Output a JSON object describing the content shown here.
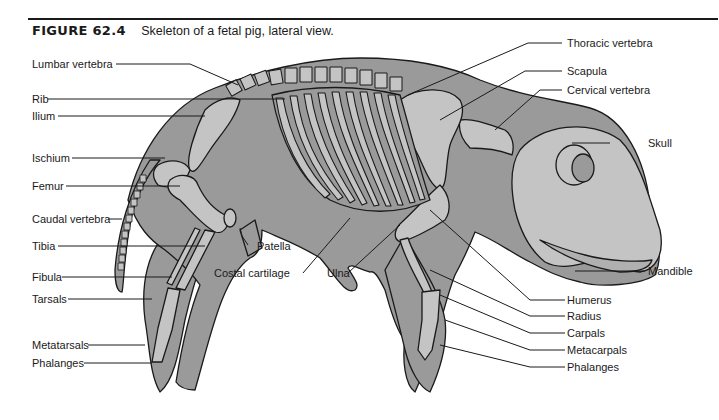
{
  "figure": {
    "number": "FIGURE 62.4",
    "caption": "Skeleton of a fetal pig, lateral view."
  },
  "colors": {
    "body": "#9a9a9a",
    "bone": "#c4c4c4",
    "outline": "#1a1a1a",
    "text": "#1a1a1a",
    "rule": "#1a1a1a"
  },
  "labels": {
    "left": [
      {
        "id": "lumbar-vertebra",
        "text": "Lumbar vertebra"
      },
      {
        "id": "rib",
        "text": "Rib"
      },
      {
        "id": "ilium",
        "text": "Ilium"
      },
      {
        "id": "ischium",
        "text": "Ischium"
      },
      {
        "id": "femur",
        "text": "Femur"
      },
      {
        "id": "caudal-vertebra",
        "text": "Caudal vertebra"
      },
      {
        "id": "tibia",
        "text": "Tibia"
      },
      {
        "id": "fibula",
        "text": "Fibula"
      },
      {
        "id": "tarsals",
        "text": "Tarsals"
      },
      {
        "id": "metatarsals",
        "text": "Metatarsals"
      },
      {
        "id": "phalanges-hind",
        "text": "Phalanges"
      }
    ],
    "bottom": [
      {
        "id": "patella",
        "text": "Patella"
      },
      {
        "id": "costal-cartilage",
        "text": "Costal cartilage"
      },
      {
        "id": "ulna",
        "text": "Ulna"
      }
    ],
    "right": [
      {
        "id": "thoracic-vertebra",
        "text": "Thoracic vertebra"
      },
      {
        "id": "scapula",
        "text": "Scapula"
      },
      {
        "id": "cervical-vertebra",
        "text": "Cervical vertebra"
      },
      {
        "id": "skull",
        "text": "Skull"
      },
      {
        "id": "mandible",
        "text": "Mandible"
      },
      {
        "id": "humerus",
        "text": "Humerus"
      },
      {
        "id": "radius",
        "text": "Radius"
      },
      {
        "id": "carpals",
        "text": "Carpals"
      },
      {
        "id": "metacarpals",
        "text": "Metacarpals"
      },
      {
        "id": "phalanges-fore",
        "text": "Phalanges"
      }
    ]
  }
}
